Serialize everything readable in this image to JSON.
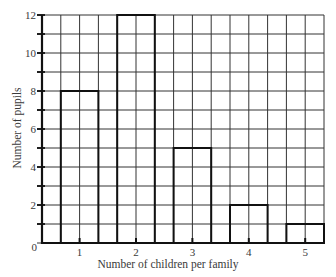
{
  "chart_data": {
    "type": "bar",
    "title": "",
    "categories": [
      "1",
      "2",
      "3",
      "4",
      "5"
    ],
    "values": [
      8,
      12,
      5,
      2,
      1
    ],
    "xlabel": "Number of children per family",
    "ylabel": "Number of pupils",
    "ylim": [
      0,
      12
    ],
    "yticks": [
      0,
      2,
      4,
      6,
      8,
      10,
      12
    ],
    "grid": true,
    "legend": null
  }
}
